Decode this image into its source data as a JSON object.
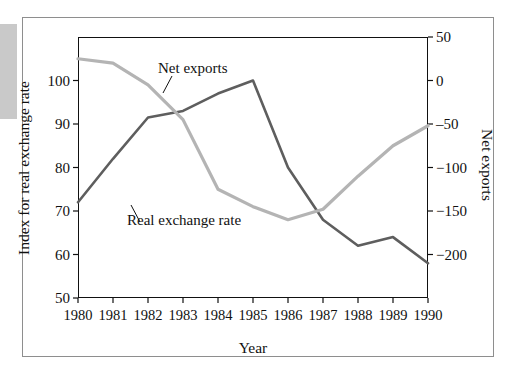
{
  "figure": {
    "background_color": "#ffffff",
    "border_color": "#8e8e8e"
  },
  "chart_data": {
    "type": "line",
    "title": "",
    "xlabel": "Year",
    "ylabel": "Index for real exchange rate",
    "y2label": "Net exports",
    "grid": false,
    "legend": "annotations-on-curve",
    "x": [
      1980,
      1981,
      1982,
      1983,
      1984,
      1985,
      1986,
      1987,
      1988,
      1989,
      1990
    ],
    "categories": [
      "1980",
      "1981",
      "1982",
      "1983",
      "1984",
      "1985",
      "1986",
      "1987",
      "1988",
      "1989",
      "1990"
    ],
    "ylim": [
      50,
      110
    ],
    "yticks": [
      50,
      60,
      70,
      80,
      90,
      100
    ],
    "yticklabels": [
      "50",
      "60",
      "70",
      "80",
      "90",
      "100"
    ],
    "y2lim": [
      -250,
      50
    ],
    "y2ticks": [
      50,
      0,
      -50,
      -100,
      -150,
      -200
    ],
    "y2ticklabels": [
      "50",
      "0",
      "‒50",
      "−100",
      "−150",
      "−200"
    ],
    "series": [
      {
        "name": "Real exchange rate",
        "axis": "left",
        "color": "#5e5e5e",
        "values": [
          72,
          82,
          91.5,
          93,
          97,
          100,
          80,
          68,
          62,
          64,
          58
        ]
      },
      {
        "name": "Net exports",
        "axis": "right",
        "color": "#b4b4b4",
        "values": [
          25,
          20,
          -5,
          -45,
          -125,
          -145,
          -160,
          -148,
          -110,
          -75,
          -52
        ]
      }
    ]
  },
  "annotations": {
    "net_exports_label": "Net exports",
    "real_exchange_rate_label": "Real exchange rate"
  },
  "axes": {
    "x_title": "Year",
    "y_left_title": "Index for real exchange rate",
    "y_right_title": "Net exports"
  }
}
